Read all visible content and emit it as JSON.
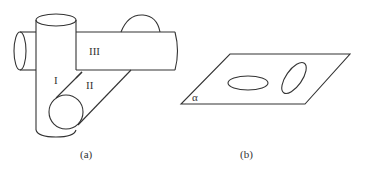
{
  "figure_a": {
    "caption": "(a)",
    "labels": {
      "region_1": "I",
      "region_2": "II",
      "region_3": "III"
    }
  },
  "figure_b": {
    "caption": "(b)",
    "plane_label": "α"
  }
}
